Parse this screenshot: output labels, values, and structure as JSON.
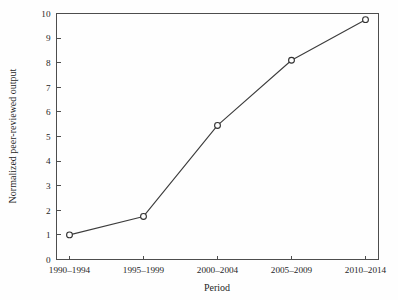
{
  "chart_data": {
    "type": "line",
    "title": "",
    "xlabel": "Period",
    "ylabel": "Normalized peer-reviewed output",
    "categories": [
      "1990–1994",
      "1995–1999",
      "2000–2004",
      "2005–2009",
      "2010–2014"
    ],
    "values": [
      1.0,
      1.75,
      5.45,
      8.1,
      9.75
    ],
    "series": [
      {
        "name": "Normalized peer-reviewed output",
        "values": [
          1.0,
          1.75,
          5.45,
          8.1,
          9.75
        ]
      }
    ],
    "ylim": [
      0,
      10
    ],
    "yticks": [
      0,
      1,
      2,
      3,
      4,
      5,
      6,
      7,
      8,
      9,
      10
    ],
    "ytick_labels": [
      "0",
      "1",
      "2",
      "3",
      "4",
      "5",
      "6",
      "7",
      "8",
      "9",
      "10"
    ],
    "xtick_labels": [
      "1990–1994",
      "1995–1999",
      "2000–2004",
      "2005–2009",
      "2010–2014"
    ],
    "grid": false,
    "legend": false,
    "legend_position": "none",
    "marker": "open-circle",
    "line_color": "#3c3c3c",
    "marker_color": "#303030",
    "axis_color": "#4d4d4d",
    "background_color": "#fefefe"
  }
}
